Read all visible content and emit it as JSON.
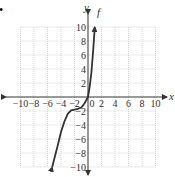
{
  "bullet": "•",
  "chart_data": {
    "type": "line",
    "title": "",
    "xlabel": "x",
    "ylabel": "y",
    "function_label": "f",
    "xlim": [
      -10,
      10
    ],
    "ylim": [
      -10,
      10
    ],
    "grid": true,
    "x_ticks": [
      -10,
      -8,
      -6,
      -4,
      -2,
      0,
      2,
      4,
      6,
      8,
      10
    ],
    "y_ticks": [
      10,
      8,
      6,
      4,
      2,
      -2,
      -4,
      -6,
      -8,
      -10
    ],
    "series": [
      {
        "name": "f",
        "x": [
          -5.3,
          -4.5,
          -4,
          -3.5,
          -3,
          -2.5,
          -2,
          -1.5,
          -1,
          -0.5,
          0,
          0.25,
          0.5,
          0.75,
          1
        ],
        "y": [
          -10,
          -7,
          -5,
          -3.5,
          -2.4,
          -1.9,
          -1.8,
          -1.7,
          -1.5,
          -0.9,
          0,
          1.5,
          3.5,
          6.5,
          10
        ],
        "arrows": "both"
      }
    ]
  }
}
